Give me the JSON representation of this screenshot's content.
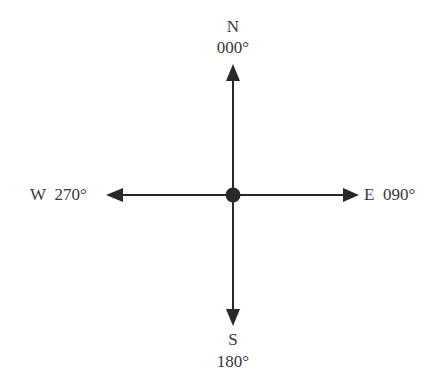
{
  "colors": {
    "ink": "#2b2728",
    "text": "#3a3637",
    "background": "#ffffff"
  },
  "directions": {
    "north": {
      "letter": "N",
      "bearing": "000°"
    },
    "east": {
      "letter": "E",
      "bearing": "090°"
    },
    "south": {
      "letter": "S",
      "bearing": "180°"
    },
    "west": {
      "letter": "W",
      "bearing": "270°"
    }
  },
  "icons": {
    "center": "center-dot",
    "arrows": "arrow-heads"
  }
}
